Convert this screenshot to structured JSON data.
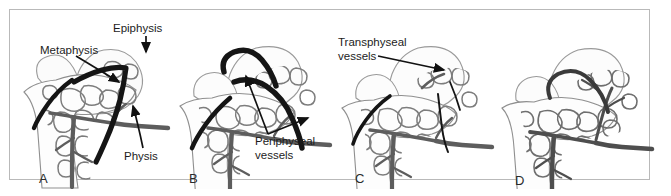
{
  "figure": {
    "border_color": "#b9b9b9",
    "background_color": "#ffffff",
    "panel_count": 4
  },
  "style": {
    "bone_outline_color": "#8d8d8d",
    "bone_fill_color": "#fdfdfd",
    "trabecular_color": "#7d7d7d",
    "vessel_gray_color": "#5d5d5d",
    "physis_black_color": "#151515",
    "label_text_color": "#1c1c1c",
    "leader_line_color": "#111111"
  },
  "panels": [
    {
      "id": "A",
      "letter": "A",
      "letter_x": 21,
      "letter_y": 152,
      "description": "Infant proximal femur with open physis shown as a thick black band; metaphyseal and epiphyseal regions separated.",
      "labels": [
        {
          "name": "epiphysis",
          "text": "Epiphysis",
          "x": 113,
          "y": 22,
          "arrow": "down"
        },
        {
          "name": "metaphysis",
          "text": "Metaphysis",
          "x": 40,
          "y": 44,
          "arrow": "diagonal-down-right"
        },
        {
          "name": "physis",
          "text": "Physis",
          "x": 124,
          "y": 152,
          "arrow": "up"
        }
      ]
    },
    {
      "id": "B",
      "letter": "B",
      "letter_x": 11,
      "letter_y": 152,
      "description": "Periphyseal vessels coursing around the periphery of the open physis.",
      "labels": [
        {
          "name": "periphyseal-vessels",
          "text": "Periphyseal\nvessels",
          "line1": "Periphyseal",
          "line2": "vessels",
          "x": 95,
          "y": 135,
          "arrow": "two-branch-up"
        }
      ]
    },
    {
      "id": "C",
      "letter": "C",
      "letter_x": 17,
      "letter_y": 152,
      "description": "Transphyseal vessels crossing the closing physis into the epiphysis.",
      "labels": [
        {
          "name": "transphyseal-vessels",
          "text": "Transphyseal\nvessels",
          "line1": "Transphyseal",
          "line2": "vessels",
          "x": 18,
          "y": 36,
          "arrow": "right"
        }
      ]
    },
    {
      "id": "D",
      "letter": "D",
      "letter_x": 17,
      "letter_y": 154,
      "description": "Mature femur after physeal closure with continuous metaphyseal-epiphyseal vasculature; no physeal line remains.",
      "labels": []
    }
  ]
}
